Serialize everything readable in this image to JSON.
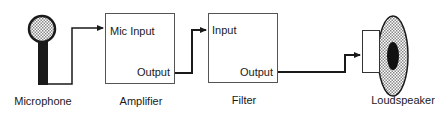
{
  "diagram": {
    "type": "block-diagram",
    "colors": {
      "stroke": "#1a1a1a",
      "background": "#ffffff",
      "hatch": "#888888"
    },
    "components": [
      {
        "id": "microphone",
        "label": "Microphone"
      },
      {
        "id": "amplifier",
        "label": "Amplifier",
        "ports": {
          "input": "Mic Input",
          "output": "Output"
        }
      },
      {
        "id": "filter",
        "label": "Filter",
        "ports": {
          "input": "Input",
          "output": "Output"
        }
      },
      {
        "id": "loudspeaker",
        "label": "Loudspeaker"
      }
    ],
    "connections": [
      {
        "from": "microphone",
        "to": "amplifier.Mic Input"
      },
      {
        "from": "amplifier.Output",
        "to": "filter.Input"
      },
      {
        "from": "filter.Output",
        "to": "loudspeaker"
      }
    ]
  },
  "labels": {
    "microphone": "Microphone",
    "amplifier": "Amplifier",
    "filter": "Filter",
    "loudspeaker": "Loudspeaker",
    "amp_input": "Mic Input",
    "amp_output": "Output",
    "filter_input": "Input",
    "filter_output": "Output"
  }
}
